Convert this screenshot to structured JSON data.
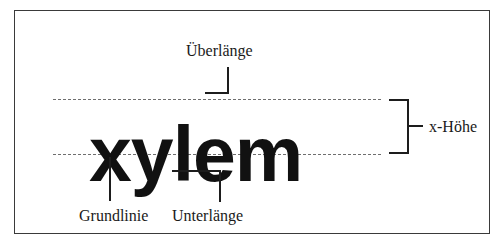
{
  "figure": {
    "specimen_word": "xylem",
    "background_color": "#ffffff",
    "frame_color": "#3a3a3a",
    "guide_color": "#6e6e6e",
    "ink_color": "#1d1d1d"
  },
  "guides": [
    {
      "name": "x-height-line",
      "label": "",
      "style": "dashed"
    },
    {
      "name": "baseline-line",
      "label": "",
      "style": "dashed"
    }
  ],
  "callouts": {
    "ascender": {
      "label": "Überlänge",
      "points_to": "ascender of letter l",
      "position": "top"
    },
    "xheight": {
      "label": "x-Höhe",
      "points_to": "band between baseline and x-height line",
      "position": "right",
      "bracket": "curly-right"
    },
    "baseline": {
      "label": "Grundlinie",
      "points_to": "baseline under letter x",
      "position": "bottom-left"
    },
    "descender": {
      "label": "Unterlänge",
      "points_to": "descender of letter y",
      "position": "bottom-center"
    }
  }
}
